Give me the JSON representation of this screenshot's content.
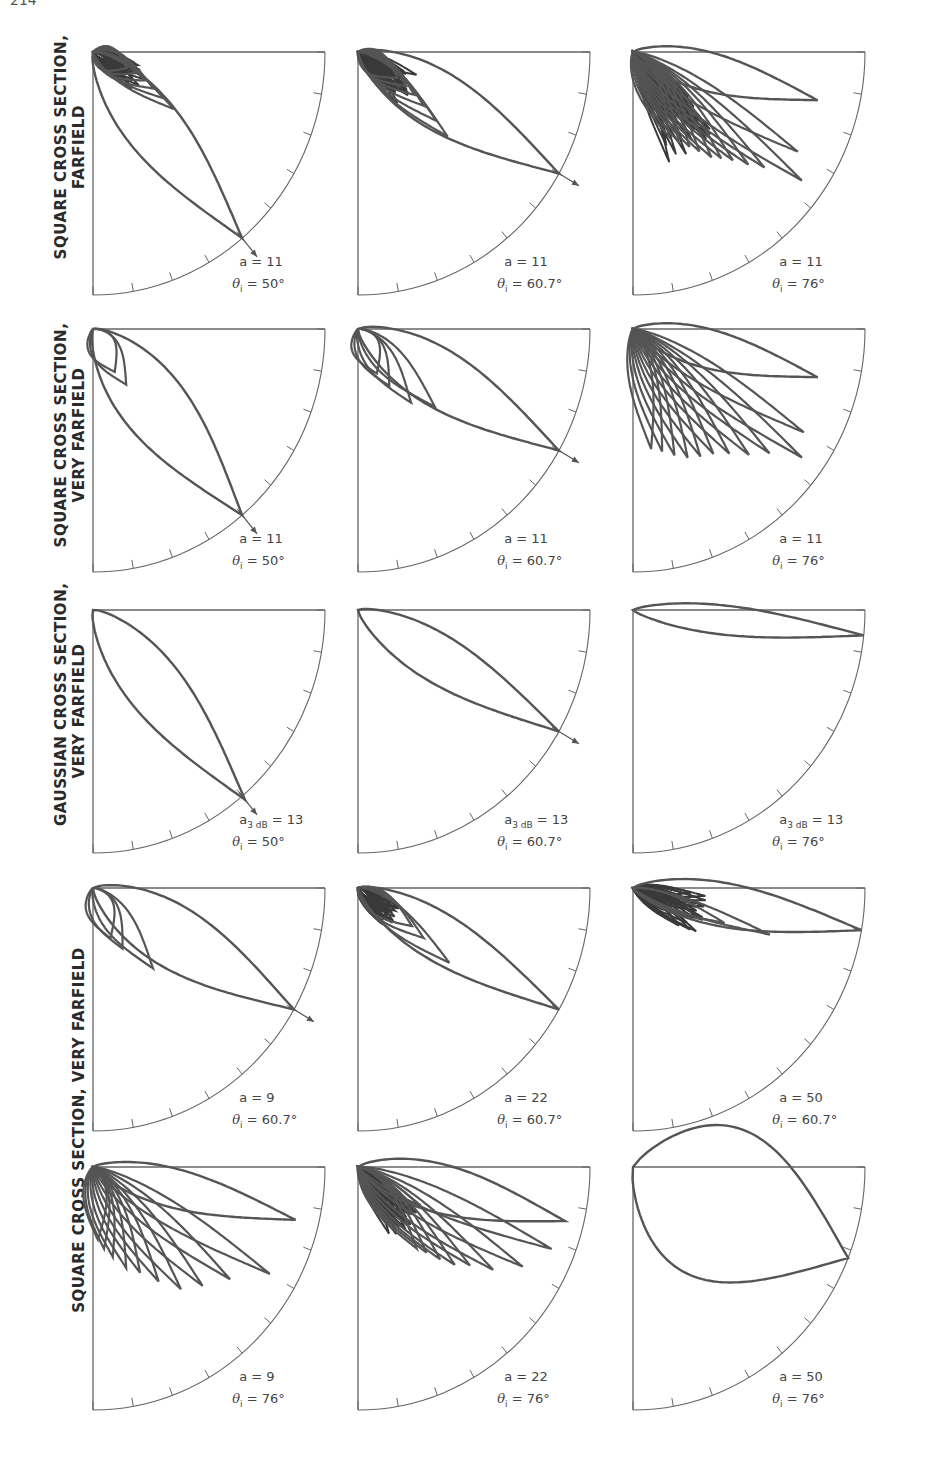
{
  "page": {
    "number": "214"
  },
  "row_labels": [
    {
      "id": "r1",
      "lines": [
        "SQUARE CROSS SECTION,",
        "FARFIELD"
      ]
    },
    {
      "id": "r2",
      "lines": [
        "SQUARE CROSS SECTION,",
        "VERY FARFIELD"
      ]
    },
    {
      "id": "r3",
      "lines": [
        "GAUSSIAN CROSS SECTION,",
        "VERY FARFIELD"
      ]
    },
    {
      "id": "r45",
      "lines": [
        "SQUARE CROSS SECTION, VERY FARFIELD"
      ]
    }
  ],
  "chart_data": {
    "type": "polar",
    "layout": {
      "rows": 5,
      "cols": 3,
      "grid": false,
      "axis": "quarter-circle with tick marks every 10 degrees"
    },
    "panels": [
      {
        "row": 1,
        "col": 1,
        "param_label": "a",
        "param_value": "11",
        "theta_i": "50°",
        "main_lobe_deg": 50,
        "sidelobes": "dense near origin, short",
        "arrow": true
      },
      {
        "row": 1,
        "col": 2,
        "param_label": "a",
        "param_value": "11",
        "theta_i": "60.7°",
        "main_lobe_deg": 30,
        "sidelobes": "dense, medium",
        "arrow": true
      },
      {
        "row": 1,
        "col": 3,
        "param_label": "a",
        "param_value": "11",
        "theta_i": "76°",
        "main_lobe_deg": 14,
        "sidelobes": "very dense, long",
        "arrow": false
      },
      {
        "row": 2,
        "col": 1,
        "param_label": "a",
        "param_value": "11",
        "theta_i": "50°",
        "main_lobe_deg": 50,
        "sidelobes": "2 small lobes",
        "arrow": true
      },
      {
        "row": 2,
        "col": 2,
        "param_label": "a",
        "param_value": "11",
        "theta_i": "60.7°",
        "main_lobe_deg": 30,
        "sidelobes": "4 small lobes",
        "arrow": true
      },
      {
        "row": 2,
        "col": 3,
        "param_label": "a",
        "param_value": "11",
        "theta_i": "76°",
        "main_lobe_deg": 14,
        "sidelobes": "many long lobes",
        "arrow": false
      },
      {
        "row": 3,
        "col": 1,
        "param_label": "a3 dB",
        "param_value": "13",
        "theta_i": "50°",
        "main_lobe_deg": 50,
        "sidelobes": "none",
        "arrow": true
      },
      {
        "row": 3,
        "col": 2,
        "param_label": "a3 dB",
        "param_value": "13",
        "theta_i": "60.7°",
        "main_lobe_deg": 30,
        "sidelobes": "none",
        "arrow": true
      },
      {
        "row": 3,
        "col": 3,
        "param_label": "a3 dB",
        "param_value": "13",
        "theta_i": "76°",
        "main_lobe_deg": 6,
        "sidelobes": "none",
        "arrow": false
      },
      {
        "row": 4,
        "col": 1,
        "param_label": "a",
        "param_value": "9",
        "theta_i": "60.7°",
        "main_lobe_deg": 30,
        "sidelobes": "3 lobes",
        "arrow": true
      },
      {
        "row": 4,
        "col": 2,
        "param_label": "a",
        "param_value": "22",
        "theta_i": "60.7°",
        "main_lobe_deg": 30,
        "sidelobes": "dense, short",
        "arrow": false
      },
      {
        "row": 4,
        "col": 3,
        "param_label": "a",
        "param_value": "50",
        "theta_i": "60.7°",
        "main_lobe_deg": 10,
        "sidelobes": "ripple",
        "arrow": false
      },
      {
        "row": 5,
        "col": 1,
        "param_label": "a",
        "param_value": "9",
        "theta_i": "76°",
        "main_lobe_deg": 14,
        "sidelobes": "many long lobes",
        "arrow": false
      },
      {
        "row": 5,
        "col": 2,
        "param_label": "a",
        "param_value": "22",
        "theta_i": "76°",
        "main_lobe_deg": 14,
        "sidelobes": "dense + long lobes",
        "arrow": false
      },
      {
        "row": 5,
        "col": 3,
        "param_label": "a",
        "param_value": "50",
        "theta_i": "76°",
        "main_lobe_deg": 22,
        "sidelobes": "ripple",
        "arrow": false
      }
    ]
  },
  "panel_geometry": {
    "col_x": [
      93,
      358,
      633
    ],
    "row_y": [
      52,
      329,
      610,
      888,
      1167
    ],
    "rx": 232,
    "ry": 243,
    "stroke": "#555555",
    "axis": "#666666"
  },
  "lobes": [
    {
      "main": [
        50,
        1.0,
        0.12
      ],
      "side": [
        [
          34,
          0.42,
          0.04
        ],
        [
          32,
          0.36,
          0.04
        ],
        [
          30,
          0.3,
          0.05
        ],
        [
          28,
          0.25,
          0.05
        ],
        [
          26,
          0.2,
          0.05
        ],
        [
          24,
          0.16,
          0.05
        ]
      ],
      "dense": [
        30,
        0.25
      ]
    },
    {
      "main": [
        30,
        1.0,
        0.12
      ],
      "side": [
        [
          42,
          0.52,
          0.05
        ],
        [
          40,
          0.44,
          0.05
        ],
        [
          38,
          0.36,
          0.05
        ],
        [
          36,
          0.3,
          0.05
        ],
        [
          34,
          0.25,
          0.05
        ],
        [
          32,
          0.2,
          0.05
        ]
      ],
      "dense": [
        38,
        0.28
      ]
    },
    {
      "main": [
        14,
        0.82,
        0.08
      ],
      "side": [
        [
          30,
          0.82,
          0.05
        ],
        [
          36,
          0.9,
          0.05
        ],
        [
          40,
          0.74,
          0.05
        ],
        [
          43,
          0.68,
          0.05
        ],
        [
          46,
          0.62,
          0.05
        ],
        [
          49,
          0.58,
          0.05
        ],
        [
          52,
          0.55,
          0.05
        ],
        [
          55,
          0.5,
          0.05
        ],
        [
          58,
          0.46,
          0.05
        ],
        [
          62,
          0.42,
          0.05
        ],
        [
          66,
          0.38,
          0.05
        ]
      ],
      "dense": [
        55,
        0.48
      ]
    },
    {
      "main": [
        50,
        1.0,
        0.14
      ],
      "side": [
        [
          62,
          0.2,
          0.06
        ],
        [
          58,
          0.27,
          0.06
        ]
      ],
      "dense": null
    },
    {
      "main": [
        30,
        1.0,
        0.12
      ],
      "side": [
        [
          66,
          0.2,
          0.06
        ],
        [
          60,
          0.27,
          0.06
        ],
        [
          53,
          0.38,
          0.06
        ],
        [
          44,
          0.46,
          0.06
        ]
      ],
      "dense": null
    },
    {
      "main": [
        14,
        0.82,
        0.08
      ],
      "side": [
        [
          30,
          0.85,
          0.05
        ],
        [
          36,
          0.9,
          0.05
        ],
        [
          41,
          0.78,
          0.05
        ],
        [
          46,
          0.72,
          0.05
        ],
        [
          51,
          0.66,
          0.05
        ],
        [
          56,
          0.62,
          0.05
        ],
        [
          61,
          0.6,
          0.05
        ],
        [
          66,
          0.58,
          0.05
        ],
        [
          71,
          0.55,
          0.05
        ],
        [
          76,
          0.52,
          0.05
        ],
        [
          81,
          0.5,
          0.05
        ]
      ],
      "dense": null
    },
    {
      "main": [
        50,
        1.02,
        0.12
      ],
      "side": [],
      "dense": null
    },
    {
      "main": [
        30,
        1.0,
        0.1
      ],
      "side": [],
      "dense": null
    },
    {
      "main": [
        6,
        1.0,
        0.06
      ],
      "side": [],
      "dense": null
    },
    {
      "main": [
        30,
        1.0,
        0.13
      ],
      "side": [
        [
          70,
          0.22,
          0.06
        ],
        [
          63,
          0.28,
          0.06
        ],
        [
          52,
          0.42,
          0.06
        ]
      ],
      "dense": null
    },
    {
      "main": [
        30,
        1.0,
        0.1
      ],
      "side": [
        [
          38,
          0.5,
          0.05
        ],
        [
          36,
          0.35,
          0.05
        ],
        [
          34,
          0.28,
          0.05
        ]
      ],
      "dense": [
        40,
        0.2
      ]
    },
    {
      "main": [
        10,
        1.0,
        0.09
      ],
      "side": [
        [
          18,
          0.62,
          0.03
        ],
        [
          20,
          0.42,
          0.03
        ]
      ],
      "dense": [
        22,
        0.33
      ]
    },
    {
      "main": [
        14,
        0.9,
        0.08
      ],
      "side": [
        [
          30,
          0.88,
          0.05
        ],
        [
          38,
          0.75,
          0.05
        ],
        [
          46,
          0.68,
          0.05
        ],
        [
          53,
          0.63,
          0.05
        ],
        [
          59,
          0.55,
          0.05
        ],
        [
          65,
          0.48,
          0.05
        ],
        [
          71,
          0.44,
          0.05
        ],
        [
          77,
          0.38,
          0.05
        ],
        [
          82,
          0.34,
          0.05
        ],
        [
          86,
          0.3,
          0.05
        ]
      ],
      "dense": null
    },
    {
      "main": [
        14,
        0.92,
        0.1
      ],
      "side": [
        [
          22,
          0.9,
          0.05
        ],
        [
          30,
          0.82,
          0.05
        ],
        [
          36,
          0.72,
          0.05
        ],
        [
          40,
          0.63,
          0.05
        ],
        [
          44,
          0.58,
          0.05
        ],
        [
          47,
          0.52,
          0.05
        ],
        [
          50,
          0.46,
          0.05
        ],
        [
          53,
          0.42,
          0.05
        ]
      ],
      "dense": [
        48,
        0.33
      ]
    },
    {
      "main": [
        22,
        1.0,
        0.32
      ],
      "side": [],
      "dense": null
    }
  ]
}
